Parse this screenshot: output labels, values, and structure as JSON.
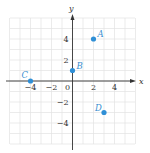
{
  "chart_data": {
    "type": "scatter",
    "title": "",
    "xlabel": "x",
    "ylabel": "y",
    "xlim": [
      -6,
      6
    ],
    "ylim": [
      -6,
      6
    ],
    "grid": true,
    "x_ticks": [
      -4,
      -2,
      0,
      2,
      4
    ],
    "x_tick_labels": [
      "−4",
      "−2",
      "0",
      "2",
      "4"
    ],
    "y_ticks": [
      4,
      2,
      -2,
      -4
    ],
    "y_tick_labels": [
      "4",
      "2",
      "−2",
      "−4"
    ],
    "points": [
      {
        "label": "A",
        "x": 2,
        "y": 4
      },
      {
        "label": "B",
        "x": 0,
        "y": 1
      },
      {
        "label": "C",
        "x": -4,
        "y": 0
      },
      {
        "label": "D",
        "x": 3,
        "y": -3
      }
    ],
    "colors": {
      "point": "#2f8fd6",
      "label": "#3a8fd0",
      "grid": "#e3e3e3",
      "axis": "#333333"
    }
  }
}
